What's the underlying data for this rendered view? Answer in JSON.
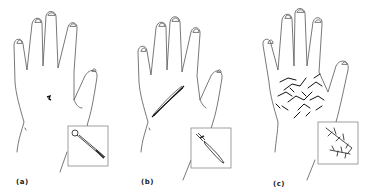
{
  "figure": {
    "panels": [
      {
        "id": "a",
        "label": "(a)",
        "wound": "puncture",
        "inset_object": "awl-icon"
      },
      {
        "id": "b",
        "label": "(b)",
        "wound": "incised",
        "inset_object": "knife-icon"
      },
      {
        "id": "c",
        "label": "(c)",
        "wound": "lacerated",
        "inset_object": "branch-icon"
      }
    ]
  }
}
